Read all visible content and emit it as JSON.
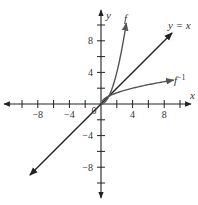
{
  "chart_data": {
    "type": "line",
    "title": "",
    "xlabel": "x",
    "ylabel": "y",
    "xlim": [
      -10,
      11
    ],
    "ylim": [
      -11,
      11
    ],
    "grid": false,
    "x_ticks": [
      -10,
      -8,
      -6,
      -4,
      -2,
      0,
      2,
      4,
      6,
      8,
      10
    ],
    "y_ticks": [
      -10,
      -8,
      -6,
      -4,
      -2,
      2,
      4,
      6,
      8,
      10
    ],
    "x_tick_labels": [
      "-8",
      "-4",
      "4",
      "8"
    ],
    "y_tick_labels": [
      "8",
      "4",
      "-4",
      "-8"
    ],
    "origin_label": "0",
    "series": [
      {
        "name": "f",
        "label": "f",
        "formula": "y = x^2, x >= 0",
        "x": [
          0,
          0.5,
          1,
          1.5,
          2,
          2.5,
          3,
          3.2
        ],
        "y": [
          0,
          0.25,
          1,
          2.25,
          4,
          6.25,
          9,
          10.24
        ]
      },
      {
        "name": "y = x",
        "label": "y = x",
        "formula": "y = x",
        "x": [
          -9,
          9
        ],
        "y": [
          -9,
          9
        ]
      },
      {
        "name": "f^-1",
        "label": "f",
        "label_sup": "−1",
        "formula": "y = sqrt(x), x >= 0",
        "x": [
          0,
          0.25,
          1,
          2,
          4,
          6,
          8,
          9
        ],
        "y": [
          0,
          0.5,
          1,
          1.414,
          2,
          2.449,
          2.828,
          3
        ]
      }
    ]
  }
}
